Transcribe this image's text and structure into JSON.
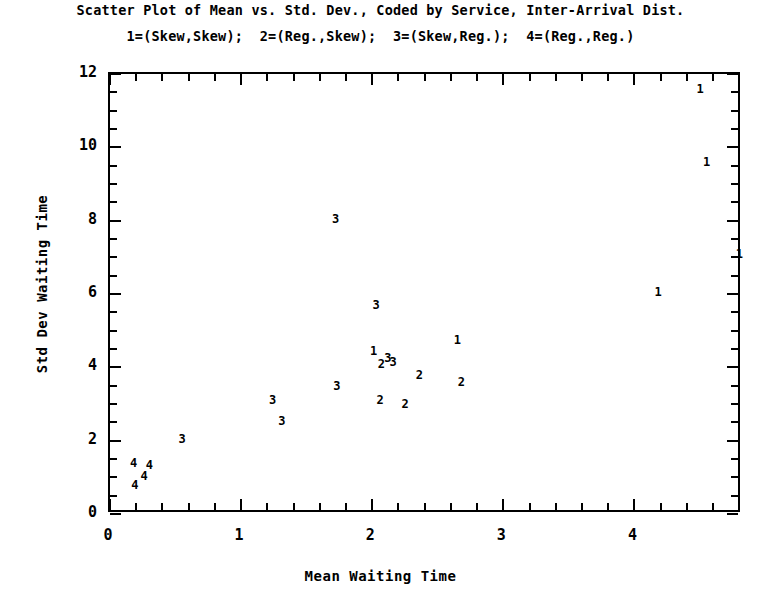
{
  "chart_data": {
    "type": "scatter",
    "title": "Scatter Plot of Mean vs. Std. Dev., Coded by Service, Inter-Arrival Dist.",
    "subtitle": "1=(Skew,Skew);  2=(Reg.,Skew);  3=(Skew,Reg.);  4=(Reg.,Reg.)",
    "xlabel": "Mean Waiting Time",
    "ylabel": "Std Dev Waiting Time",
    "xlim": [
      0,
      4.82
    ],
    "ylim": [
      0,
      12
    ],
    "xticks": [
      0,
      1,
      2,
      3,
      4
    ],
    "yticks": [
      0,
      2,
      4,
      6,
      8,
      10,
      12
    ],
    "xtick_labels": [
      "0",
      "1",
      "2",
      "3",
      "4"
    ],
    "ytick_labels": [
      "0",
      "2",
      "4",
      "6",
      "8",
      "10",
      "12"
    ],
    "x_minor_step": 0.2,
    "y_minor_step": 0.5,
    "grid": false,
    "legend_position": "subtitle",
    "legend_entries": [
      {
        "code": "1",
        "label": "(Skew,Skew)"
      },
      {
        "code": "2",
        "label": "(Reg.,Skew)"
      },
      {
        "code": "3",
        "label": "(Skew,Reg.)"
      },
      {
        "code": "4",
        "label": "(Reg.,Reg.)"
      }
    ],
    "marker_style": "digit-code",
    "points": [
      {
        "x": 4.5,
        "y": 11.6,
        "code": "1"
      },
      {
        "x": 4.55,
        "y": 9.6,
        "code": "1"
      },
      {
        "x": 1.72,
        "y": 8.05,
        "code": "3"
      },
      {
        "x": 4.8,
        "y": 7.1,
        "code": "1"
      },
      {
        "x": 4.18,
        "y": 6.05,
        "code": "1"
      },
      {
        "x": 2.03,
        "y": 5.7,
        "code": "3"
      },
      {
        "x": 2.65,
        "y": 4.75,
        "code": "1"
      },
      {
        "x": 2.01,
        "y": 4.45,
        "code": "1"
      },
      {
        "x": 2.12,
        "y": 4.25,
        "code": "3"
      },
      {
        "x": 2.07,
        "y": 4.1,
        "code": "2"
      },
      {
        "x": 2.16,
        "y": 4.15,
        "code": "3"
      },
      {
        "x": 2.36,
        "y": 3.8,
        "code": "2"
      },
      {
        "x": 2.68,
        "y": 3.6,
        "code": "2"
      },
      {
        "x": 1.73,
        "y": 3.5,
        "code": "3"
      },
      {
        "x": 1.24,
        "y": 3.12,
        "code": "3"
      },
      {
        "x": 2.06,
        "y": 3.1,
        "code": "2"
      },
      {
        "x": 2.25,
        "y": 3.0,
        "code": "2"
      },
      {
        "x": 1.31,
        "y": 2.55,
        "code": "3"
      },
      {
        "x": 0.55,
        "y": 2.05,
        "code": "3"
      },
      {
        "x": 0.18,
        "y": 1.4,
        "code": "4"
      },
      {
        "x": 0.3,
        "y": 1.35,
        "code": "4"
      },
      {
        "x": 0.26,
        "y": 1.05,
        "code": "4"
      },
      {
        "x": 0.19,
        "y": 0.78,
        "code": "4"
      }
    ]
  }
}
